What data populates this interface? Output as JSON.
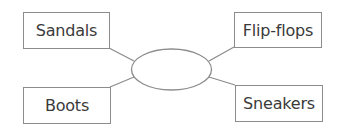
{
  "diagram": {
    "type": "spider-map",
    "center": {
      "label": ""
    },
    "nodes": [
      {
        "id": "sandals",
        "label": "Sandals",
        "position": "top-left"
      },
      {
        "id": "flip-flops",
        "label": "Flip-flops",
        "position": "top-right"
      },
      {
        "id": "boots",
        "label": "Boots",
        "position": "bottom-left"
      },
      {
        "id": "sneakers",
        "label": "Sneakers",
        "position": "bottom-right"
      }
    ],
    "colors": {
      "stroke": "#8c8c8c",
      "text": "#3a3a3a",
      "background": "#ffffff"
    }
  }
}
